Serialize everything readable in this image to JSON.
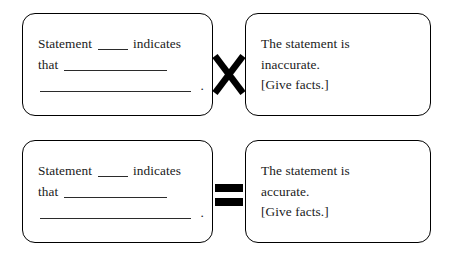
{
  "worksheet": {
    "rows": [
      {
        "id": "inaccurate-row",
        "operator": "multiply-x",
        "left_box": {
          "line1_prefix": "Statement",
          "line1_suffix": "indicates",
          "line2_prefix": "that",
          "line3_period": "."
        },
        "right_box": {
          "line1": "The statement is",
          "line2": "inaccurate.",
          "line3": "[Give facts.]"
        }
      },
      {
        "id": "accurate-row",
        "operator": "equals",
        "left_box": {
          "line1_prefix": "Statement",
          "line1_suffix": "indicates",
          "line2_prefix": "that",
          "line3_period": "."
        },
        "right_box": {
          "line1": "The statement is",
          "line2": "accurate.",
          "line3": "[Give facts.]"
        }
      }
    ],
    "colors": {
      "ink": "#1a1a1a",
      "border": "#000000",
      "rule": "#2b2b2b",
      "background": "#ffffff"
    }
  }
}
